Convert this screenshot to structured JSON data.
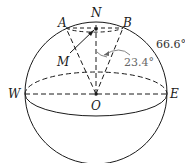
{
  "diagram": {
    "type": "sphere-geometry",
    "labels": {
      "north": "N",
      "a": "A",
      "b": "B",
      "m": "M",
      "west": "W",
      "east": "E",
      "center": "O"
    },
    "angles": {
      "arctic_circle": "66.6°",
      "tilt": "23.4°"
    },
    "colors": {
      "stroke": "#1a1a1a",
      "annotation": "#666666"
    }
  }
}
